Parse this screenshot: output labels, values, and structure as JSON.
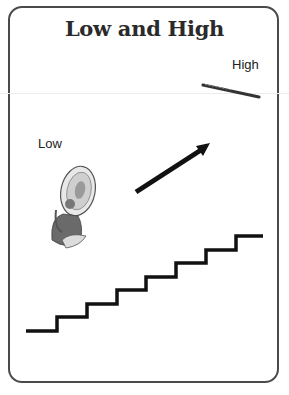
{
  "card": {
    "title": "Low and High",
    "high_label": "High",
    "low_label": "Low"
  },
  "illustrations": {
    "high_instrument": "flute-icon",
    "low_instrument": "tuba-player-icon",
    "direction": "up-right-arrow-icon",
    "staircase": "staircase-icon",
    "staircase_steps": 8
  },
  "colors": {
    "border": "#4a4a4a",
    "ink": "#111111",
    "background": "#ffffff"
  }
}
